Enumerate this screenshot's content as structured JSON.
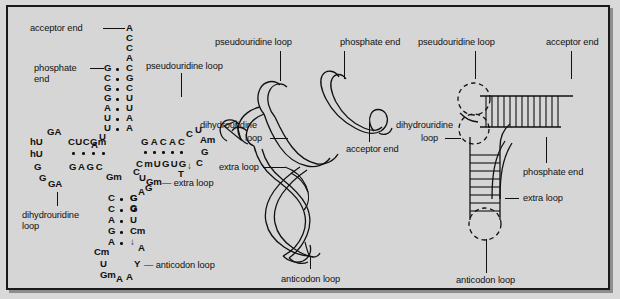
{
  "figure": {
    "background_color": "#d6d6d6",
    "ink_color": "#111111"
  },
  "cloverleaf": {
    "labels": {
      "acceptor_end": "acceptor end",
      "phosphate_end_1": "phosphate",
      "phosphate_end_2": "end",
      "pseudouridine_loop": "pseudouridine loop",
      "dihydrouridine_loop_1": "dihydrouridine",
      "dihydrouridine_loop_2": "loop",
      "extra_loop": "— extra loop",
      "anticodon_loop": "— anticodon loop"
    },
    "acceptor_stem": {
      "right_strand": [
        "A",
        "C",
        "C",
        "A",
        "C",
        "G",
        "C",
        "U",
        "U",
        "A",
        "A"
      ],
      "left_strand": [
        "G",
        "C",
        "G",
        "G",
        "A",
        "U",
        "U"
      ],
      "pair_count": 7,
      "turn_bases": [
        "U",
        "A"
      ]
    },
    "t_stem": {
      "top_strand": "GACAC",
      "bottom_strand": "CmUGUG",
      "pair_count": 5,
      "loop_bases": [
        "C",
        "U",
        "Am",
        "G",
        "C",
        "ψ",
        "T"
      ]
    },
    "d_stem": {
      "top_strand": "CUCGm",
      "bottom_strand": "GAGC",
      "pair_count": 4,
      "loop_bases": [
        "A",
        "G",
        "A",
        "hU",
        "hU",
        "G",
        "G",
        "G",
        "A"
      ]
    },
    "extra_loop_bases": [
      "C",
      "U",
      "Gm",
      "G",
      "A",
      "G",
      "G",
      "Gm"
    ],
    "anticodon_stem": {
      "left_strand": [
        "C",
        "C",
        "A",
        "G",
        "A"
      ],
      "right_strand": [
        "G",
        "G",
        "U",
        "Cm",
        "ψ"
      ],
      "pair_count": 5
    },
    "anticodon_loop_bases": [
      "Cm",
      "U",
      "Gm",
      "A",
      "A",
      "Y",
      "A"
    ]
  },
  "tertiary_model": {
    "labels": {
      "pseudouridine_loop": "pseudouridine loop",
      "phosphate_end": "phosphate end",
      "dihydrouridine_loop_1": "dihydrouridine",
      "dihydrouridine_loop_2": "loop",
      "acceptor_end": "acceptor end",
      "extra_loop": "extra loop",
      "anticodon_loop": "anticodon loop"
    }
  },
  "schematic": {
    "labels": {
      "pseudouridine_loop": "pseudouridine loop",
      "acceptor_end": "acceptor end",
      "dihydrouridine_loop_1": "dihydrouridine",
      "dihydrouridine_loop_2": "loop",
      "phosphate_end": "phosphate end",
      "extra_loop": "extra loop",
      "anticodon_loop": "anticodon loop"
    }
  }
}
